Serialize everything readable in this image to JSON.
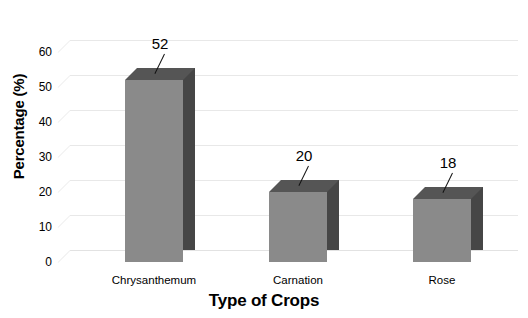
{
  "chart_data": {
    "type": "bar",
    "title": "",
    "xlabel": "Type of Crops",
    "ylabel": "Percentage (%)",
    "categories": [
      "Chrysanthemum",
      "Carnation",
      "Rose"
    ],
    "values": [
      52,
      20,
      18
    ],
    "ylim": [
      0,
      60
    ],
    "yticks": [
      0,
      10,
      20,
      30,
      40,
      50,
      60
    ],
    "ytick_labels": [
      "0",
      "10",
      "20",
      "30",
      "40",
      "50",
      "60"
    ],
    "data_labels": [
      "52",
      "20",
      "18"
    ],
    "grid": true,
    "legend": false,
    "style": "3d-column",
    "colors": {
      "bar_front": "#8a8a8a",
      "bar_side": "#464646",
      "bar_top": "#555555",
      "gridline": "#e8e8e8",
      "depth_line": "#eeeeee",
      "text": "#000000",
      "background": "#ffffff"
    }
  }
}
